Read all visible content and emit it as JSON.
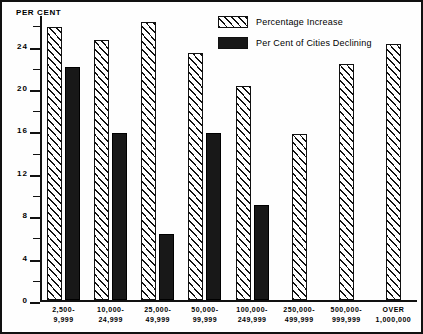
{
  "chart_data": {
    "type": "bar",
    "title": "",
    "xlabel": "",
    "ylabel": "PER CENT",
    "ylim": [
      0,
      26.8
    ],
    "ytick_labels": [
      "0",
      "4",
      "8",
      "12",
      "16",
      "20",
      "24"
    ],
    "ytick_values": [
      0,
      4,
      8,
      12,
      16,
      20,
      24
    ],
    "minor_tick_values": [
      2,
      6,
      10,
      14,
      18,
      22,
      26
    ],
    "grid": false,
    "legend_position": "top-right",
    "categories": [
      {
        "line1": "2,500-",
        "line2": "9,999"
      },
      {
        "line1": "10,000-",
        "line2": "24,999"
      },
      {
        "line1": "25,000-",
        "line2": "49,999"
      },
      {
        "line1": "50,000-",
        "line2": "99,999"
      },
      {
        "line1": "100,000-",
        "line2": "249,999"
      },
      {
        "line1": "250,000-",
        "line2": "499,999"
      },
      {
        "line1": "500,000-",
        "line2": "999,999"
      },
      {
        "line1": "OVER",
        "line2": "1,000,000"
      }
    ],
    "series": [
      {
        "name": "Percentage Increase",
        "pattern": "hatched",
        "values": [
          25.8,
          24.5,
          26.2,
          23.3,
          20.2,
          15.7,
          22.3,
          24.2
        ]
      },
      {
        "name": "Per Cent of Cities Declining",
        "pattern": "solid-black",
        "values": [
          22.0,
          15.8,
          6.2,
          15.8,
          9.0,
          null,
          null,
          null
        ]
      }
    ]
  },
  "legend": {
    "items": [
      {
        "label": "Percentage Increase",
        "pattern": "hatched"
      },
      {
        "label": "Per Cent of Cities Declining",
        "pattern": "solid-black"
      }
    ]
  },
  "axis": {
    "y_title": "PER CENT"
  },
  "colors": {
    "ink": "#111111",
    "solid_bar": "#181818",
    "background": "#fefefe"
  }
}
